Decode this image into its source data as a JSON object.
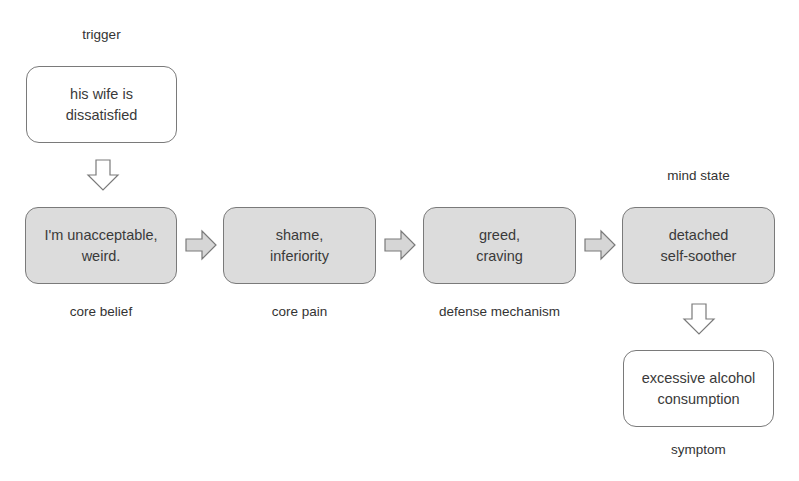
{
  "diagram": {
    "type": "flowchart",
    "nodes": [
      {
        "id": "trigger",
        "text": "his wife is\ndissatisfied",
        "label": "trigger",
        "style": "white"
      },
      {
        "id": "core-belief",
        "text": "I'm unacceptable,\nweird.",
        "label": "core belief",
        "style": "grey"
      },
      {
        "id": "core-pain",
        "text": "shame,\ninferiority",
        "label": "core pain",
        "style": "grey"
      },
      {
        "id": "defense-mechanism",
        "text": "greed,\ncraving",
        "label": "defense mechanism",
        "style": "grey"
      },
      {
        "id": "mind-state",
        "text": "detached\nself-soother",
        "label": "mind state",
        "style": "grey"
      },
      {
        "id": "symptom",
        "text": "excessive alcohol\nconsumption",
        "label": "symptom",
        "style": "white"
      }
    ],
    "edges": [
      {
        "from": "trigger",
        "to": "core-belief",
        "direction": "down"
      },
      {
        "from": "core-belief",
        "to": "core-pain",
        "direction": "right"
      },
      {
        "from": "core-pain",
        "to": "defense-mechanism",
        "direction": "right"
      },
      {
        "from": "defense-mechanism",
        "to": "mind-state",
        "direction": "right"
      },
      {
        "from": "mind-state",
        "to": "symptom",
        "direction": "down"
      }
    ],
    "colors": {
      "grey_fill": "#dcdcdc",
      "white_fill": "#ffffff",
      "border": "#7a7a7a",
      "arrow_fill": "#d6d6d6"
    }
  }
}
